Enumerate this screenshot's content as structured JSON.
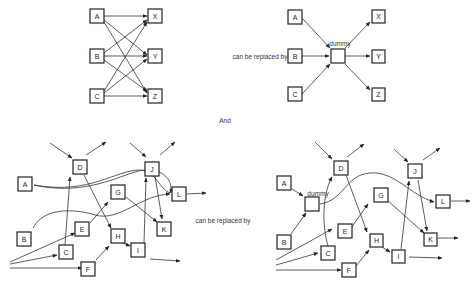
{
  "top": {
    "left_nodes": [
      "A",
      "B",
      "C"
    ],
    "right_nodes": [
      "X",
      "Y",
      "Z"
    ],
    "caption": "can be replaced by",
    "dummy_label": "dummy"
  },
  "separator": "And",
  "bottom": {
    "nodes": [
      "A",
      "B",
      "C",
      "D",
      "E",
      "F",
      "G",
      "H",
      "I",
      "J",
      "K",
      "L"
    ],
    "caption": "can be replaced by",
    "dummy_label": "dummy"
  }
}
